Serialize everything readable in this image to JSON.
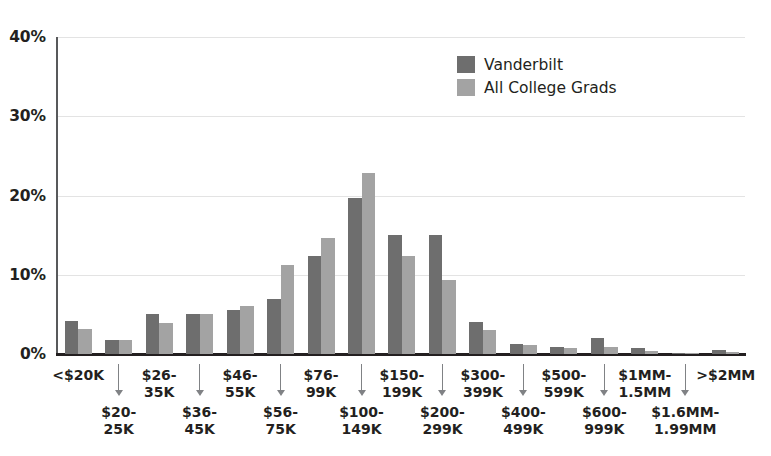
{
  "chart_data": {
    "type": "bar",
    "title": "",
    "xlabel": "",
    "ylabel": "",
    "ylim": [
      0,
      40
    ],
    "grid": true,
    "legend_position": "top-center-right",
    "ytick_labels": [
      "0%",
      "10%",
      "20%",
      "30%",
      "40%"
    ],
    "ytick_values": [
      0,
      10,
      20,
      30,
      40
    ],
    "categories": [
      "<$20K",
      "$20-25K",
      "$26-35K",
      "$36-45K",
      "$46-55K",
      "$56-75K",
      "$76-99K",
      "$100-149K",
      "$150-199K",
      "$200-299K",
      "$300-399K",
      "$400-499K",
      "$500-599K",
      "$600-999K",
      "$1MM-1.5MM",
      "$1.6MM-1.99MM",
      ">$2MM"
    ],
    "category_lines": [
      [
        "<$20K"
      ],
      [
        "$20-",
        "25K"
      ],
      [
        "$26-",
        "35K"
      ],
      [
        "$36-",
        "45K"
      ],
      [
        "$46-",
        "55K"
      ],
      [
        "$56-",
        "75K"
      ],
      [
        "$76-",
        "99K"
      ],
      [
        "$100-",
        "149K"
      ],
      [
        "$150-",
        "199K"
      ],
      [
        "$200-",
        "299K"
      ],
      [
        "$300-",
        "399K"
      ],
      [
        "$400-",
        "499K"
      ],
      [
        "$500-",
        "599K"
      ],
      [
        "$600-",
        "999K"
      ],
      [
        "$1MM-",
        "1.5MM"
      ],
      [
        "$1.6MM-",
        "1.99MM"
      ],
      [
        ">$2MM"
      ]
    ],
    "series": [
      {
        "name": "Vanderbilt",
        "color": "#6e6e6e",
        "values": [
          4.2,
          1.8,
          5.0,
          5.1,
          5.6,
          6.9,
          12.4,
          19.7,
          15.0,
          15.0,
          4.0,
          1.3,
          0.9,
          2.0,
          0.7,
          0.1,
          0.5
        ]
      },
      {
        "name": "All College Grads",
        "color": "#a3a3a3",
        "values": [
          3.1,
          1.8,
          3.9,
          5.0,
          6.0,
          11.2,
          14.7,
          22.9,
          12.4,
          9.4,
          3.0,
          1.2,
          0.8,
          0.9,
          0.4,
          0.1,
          0.3
        ]
      }
    ]
  },
  "legend": {
    "items": [
      {
        "label": "Vanderbilt",
        "color": "#6e6e6e"
      },
      {
        "label": "All College Grads",
        "color": "#a3a3a3"
      }
    ]
  }
}
